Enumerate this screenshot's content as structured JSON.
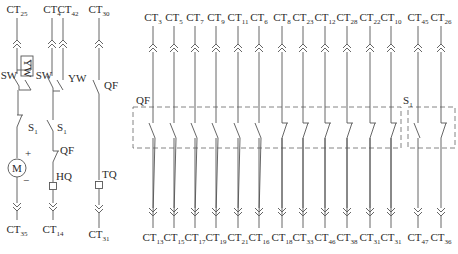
{
  "diagram": {
    "type": "electrical-control-circuit",
    "colors": {
      "line": "#555555",
      "text": "#2a2a2a",
      "background": "#ffffff"
    },
    "left_circuits": [
      {
        "id": "motor-circuit",
        "top_terminal": {
          "base": "CT",
          "sub": "25"
        },
        "bottom_terminal": {
          "base": "CT",
          "sub": "35"
        },
        "components": [
          {
            "label": "SW",
            "kind": "switch-no"
          },
          {
            "label": "YW",
            "kind": "switch-no",
            "rotated": true
          },
          {
            "label": "S",
            "sub": "1",
            "kind": "switch-nc"
          },
          {
            "label": "M",
            "kind": "motor",
            "plus": "+",
            "minus": "−"
          }
        ]
      },
      {
        "id": "close-coil-circuit",
        "top_terminal": {
          "base": "CT",
          "sub": "4"
        },
        "top_terminal_2": {
          "base": "CT",
          "sub": "42"
        },
        "bottom_terminal": {
          "base": "CT",
          "sub": "14"
        },
        "components": [
          {
            "label": "SW",
            "kind": "switch-no"
          },
          {
            "label": "YW",
            "kind": "switch-no"
          },
          {
            "label": "S",
            "sub": "1",
            "kind": "switch-no"
          },
          {
            "label": "QF",
            "kind": "switch-nc"
          },
          {
            "label": "HQ",
            "kind": "coil"
          }
        ]
      },
      {
        "id": "trip-coil-circuit",
        "top_terminal": {
          "base": "CT",
          "sub": "30"
        },
        "bottom_terminal": {
          "base": "CT",
          "sub": "31"
        },
        "components": [
          {
            "label": "QF",
            "kind": "switch-no"
          },
          {
            "label": "TQ",
            "kind": "coil"
          }
        ]
      }
    ],
    "qf_group": {
      "label": "QF",
      "contacts": [
        {
          "top": {
            "base": "CT",
            "sub": "3"
          },
          "bottom": {
            "base": "CT",
            "sub": "13"
          },
          "kind": "no"
        },
        {
          "top": {
            "base": "CT",
            "sub": "5"
          },
          "bottom": {
            "base": "CT",
            "sub": "15"
          },
          "kind": "no"
        },
        {
          "top": {
            "base": "CT",
            "sub": "7"
          },
          "bottom": {
            "base": "CT",
            "sub": "17"
          },
          "kind": "no"
        },
        {
          "top": {
            "base": "CT",
            "sub": "9"
          },
          "bottom": {
            "base": "CT",
            "sub": "19"
          },
          "kind": "no"
        },
        {
          "top": {
            "base": "CT",
            "sub": "11"
          },
          "bottom": {
            "base": "CT",
            "sub": "21"
          },
          "kind": "no"
        },
        {
          "top": {
            "base": "CT",
            "sub": "6"
          },
          "bottom": {
            "base": "CT",
            "sub": "16"
          },
          "kind": "no"
        },
        {
          "top": {
            "base": "CT",
            "sub": "8"
          },
          "bottom": {
            "base": "CT",
            "sub": "18"
          },
          "kind": "nc"
        },
        {
          "top": {
            "base": "CT",
            "sub": "23"
          },
          "bottom": {
            "base": "CT",
            "sub": "33"
          },
          "kind": "nc"
        },
        {
          "top": {
            "base": "CT",
            "sub": "12"
          },
          "bottom": {
            "base": "CT",
            "sub": "46"
          },
          "kind": "nc"
        },
        {
          "top": {
            "base": "CT",
            "sub": "28"
          },
          "bottom": {
            "base": "CT",
            "sub": "38"
          },
          "kind": "nc"
        },
        {
          "top": {
            "base": "CT",
            "sub": "22"
          },
          "bottom": {
            "base": "CT",
            "sub": "31"
          },
          "kind": "nc"
        },
        {
          "top": {
            "base": "CT",
            "sub": "10"
          },
          "bottom": {
            "base": "CT",
            "sub": "31"
          },
          "kind": "nc"
        }
      ]
    },
    "s1_group": {
      "label": "S",
      "sub": "1",
      "contacts": [
        {
          "top": {
            "base": "CT",
            "sub": "45"
          },
          "bottom": {
            "base": "CT",
            "sub": "47"
          },
          "kind": "no"
        },
        {
          "top": {
            "base": "CT",
            "sub": "26"
          },
          "bottom": {
            "base": "CT",
            "sub": "36"
          },
          "kind": "nc"
        }
      ]
    }
  }
}
